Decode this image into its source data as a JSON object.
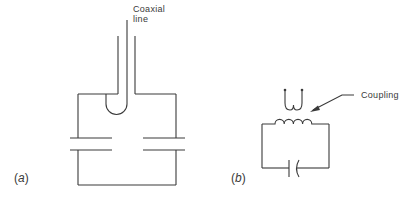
{
  "figure": {
    "panels": [
      {
        "id": "a",
        "label_open": "(",
        "label_letter": "a",
        "label_close": ")",
        "annotation_line1": "Coaxial",
        "annotation_line2": "line",
        "components": [
          "coaxial-line",
          "coupling-loop",
          "cavity-enclosure",
          "capacitor-left-gap",
          "capacitor-right-gap"
        ]
      },
      {
        "id": "b",
        "label_open": "(",
        "label_letter": "b",
        "label_close": ")",
        "annotation": "Coupling",
        "components": [
          "coupling-loop",
          "inductor",
          "capacitor",
          "coupling-arrow"
        ]
      }
    ],
    "colors": {
      "stroke": "#3a3a3a",
      "background": "#ffffff"
    }
  }
}
